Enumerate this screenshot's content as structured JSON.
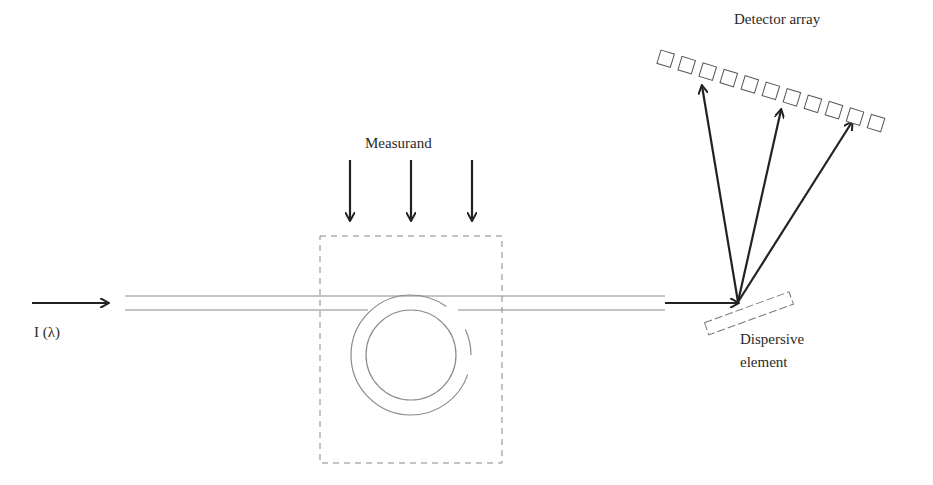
{
  "diagram": {
    "type": "fiber-optic wavelength-encoded sensor schematic",
    "labels": {
      "input": "I (λ)",
      "measurand": "Measurand",
      "detector_array": "Detector array",
      "dispersive_line1": "Dispersive",
      "dispersive_line2": "element"
    },
    "components": {
      "input_arrow": "arrow into fiber",
      "fiber": "optical fiber (double line)",
      "sensing_region": "dashed box with fiber loop",
      "measurand_arrows": 3,
      "dispersive_element": "tilted rectangular grating",
      "diffracted_rays": 3,
      "detector_elements": 11
    },
    "colors": {
      "arrow": "#222222",
      "fiber": "#8a8a8a",
      "dashed": "#888888",
      "text": "#2a2a2a"
    }
  }
}
